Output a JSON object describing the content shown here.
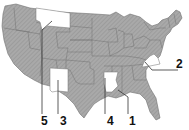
{
  "map": {
    "type": "US states locator map",
    "colors": {
      "state_fill": "#a9a9a9",
      "hatch": "#8c8c8c",
      "border": "#6e6e6e",
      "highlight_fill": "#ffffff",
      "leader_line": "#333333",
      "label_text": "#111111"
    },
    "highlighted_states": [
      {
        "number": "1",
        "label": "1"
      },
      {
        "number": "2",
        "label": "2"
      },
      {
        "number": "3",
        "label": "3"
      },
      {
        "number": "4",
        "label": "4"
      },
      {
        "number": "5",
        "label": "5"
      }
    ]
  }
}
